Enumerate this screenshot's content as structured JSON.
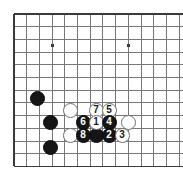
{
  "figure": {
    "kind": "go-board-diagram",
    "board_width_px": 183,
    "board_height_px": 174,
    "background_color": "#ffffff"
  },
  "board": {
    "grid_color": "#777777",
    "border_color": "#3a3a3a",
    "line_spacing_px": 12.7,
    "origin_x_px": 14,
    "origin_y_px": 14,
    "columns": 14,
    "rows": 12,
    "edges": {
      "top": true,
      "left": true,
      "bottom": true,
      "right": false
    },
    "star_points": [
      {
        "name": "star-point-left",
        "x": 52.5,
        "y": 45.5
      },
      {
        "name": "star-point-right",
        "x": 128.5,
        "y": 45.5
      }
    ],
    "star_point_size_px": 3.4
  },
  "colors": {
    "black_stone": "#151515",
    "white_stone": "#ffffff",
    "white_stone_outline": "#6e6e6e",
    "black_label": "#ffffff",
    "white_label": "#1a1a1a",
    "grid": "#777777",
    "border": "#3a3a3a"
  },
  "stones": [
    {
      "name": "black-stone-upper-left",
      "color": "black",
      "label": "",
      "x": 37.4,
      "y": 98.0,
      "d": 15
    },
    {
      "name": "black-stone-mid-left",
      "color": "black",
      "label": "",
      "x": 50.1,
      "y": 122.4,
      "d": 15
    },
    {
      "name": "black-stone-lower-left",
      "color": "black",
      "label": "",
      "x": 50.1,
      "y": 147.2,
      "d": 15
    },
    {
      "name": "white-stone-plain-upper",
      "color": "white",
      "label": "",
      "x": 70.0,
      "y": 110.0,
      "d": 15
    },
    {
      "name": "white-stone-plain-lower",
      "color": "white",
      "label": "",
      "x": 70.0,
      "y": 135.0,
      "d": 15
    },
    {
      "name": "white-stone-plain-right",
      "color": "white",
      "label": "",
      "x": 128.2,
      "y": 122.4,
      "d": 15
    },
    {
      "name": "white-stone-move-7",
      "color": "white",
      "label": "7",
      "x": 96.0,
      "y": 110.0,
      "d": 15
    },
    {
      "name": "white-stone-move-5",
      "color": "white",
      "label": "5",
      "x": 109.0,
      "y": 110.0,
      "d": 15
    },
    {
      "name": "black-stone-move-6",
      "color": "black",
      "label": "6",
      "x": 83.0,
      "y": 122.4,
      "d": 15
    },
    {
      "name": "white-stone-move-1",
      "color": "white",
      "label": "1",
      "x": 96.0,
      "y": 122.4,
      "d": 15
    },
    {
      "name": "black-stone-move-4",
      "color": "black",
      "label": "4",
      "x": 109.0,
      "y": 122.4,
      "d": 15
    },
    {
      "name": "black-stone-move-8",
      "color": "black",
      "label": "8",
      "x": 83.0,
      "y": 135.0,
      "d": 15
    },
    {
      "name": "black-stone-plain-center",
      "color": "black",
      "label": "",
      "x": 96.0,
      "y": 135.0,
      "d": 15
    },
    {
      "name": "black-stone-move-2",
      "color": "black",
      "label": "2",
      "x": 109.0,
      "y": 135.0,
      "d": 15
    },
    {
      "name": "white-stone-move-3",
      "color": "white",
      "label": "3",
      "x": 122.0,
      "y": 135.0,
      "d": 15
    }
  ],
  "move_sequence": [
    "1",
    "2",
    "3",
    "4",
    "5",
    "6",
    "7",
    "8"
  ],
  "label_font_size_px": 10
}
